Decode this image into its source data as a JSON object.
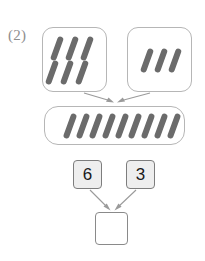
{
  "worksheet": {
    "problem_label": "(2)",
    "type": "addition-with-tally-sticks",
    "colors": {
      "background": "#ffffff",
      "stick": "#6b6b6b",
      "box_border": "#b6b6b6",
      "arrow": "#9a9a9a",
      "number_card_fill": "#eeeeee",
      "number_card_border": "#7d7d7d",
      "number_text": "#1a1a1a",
      "label_text": "#8e8e8e",
      "answer_box_border": "#8a8a8a"
    }
  },
  "groups": {
    "addend_left": {
      "name": "first-group",
      "stick_count": 6,
      "rows": 2,
      "columns": 3
    },
    "addend_right": {
      "name": "second-group",
      "stick_count": 3,
      "rows": 1,
      "columns": 3
    },
    "total": {
      "name": "combined-group",
      "stick_count": 9,
      "rows": 1,
      "columns": 9
    }
  },
  "number_sentence": {
    "addend_a": "6",
    "addend_b": "3",
    "answer": ""
  },
  "arrows": [
    {
      "name": "arrow-left-group-to-total",
      "from": "addend_left_box",
      "to": "total_box"
    },
    {
      "name": "arrow-right-group-to-total",
      "from": "addend_right_box",
      "to": "total_box"
    },
    {
      "name": "arrow-card-six-to-answer",
      "from": "number_card_6",
      "to": "answer_box"
    },
    {
      "name": "arrow-card-three-to-answer",
      "from": "number_card_3",
      "to": "answer_box"
    }
  ]
}
